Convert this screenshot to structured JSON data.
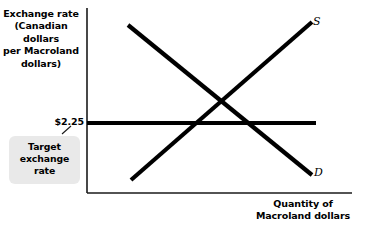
{
  "figure": {
    "background": "#ffffff",
    "ink_color": "#000000",
    "callout_bg": "#e9e9e9"
  },
  "axes": {
    "y_title": "Exchange rate (Canadian dollars per Macroland dollars)",
    "y_title_lines": [
      "Exchange rate",
      "(Canadian",
      "dollars",
      "per Macroland",
      "dollars)"
    ],
    "x_title": "Quantity of Macroland dollars",
    "x_title_lines": [
      "Quantity of",
      "Macroland dollars"
    ]
  },
  "annotations": {
    "target_rate_value": "$2.25",
    "target_callout_lines": [
      "Target",
      "exchange",
      "rate"
    ],
    "target_callout_text": "Target exchange rate"
  },
  "curves": {
    "supply_label": "S",
    "demand_label": "D"
  },
  "chart_data": {
    "type": "line",
    "title": "",
    "subtitle": "",
    "xlabel": "Quantity of Macroland dollars",
    "ylabel": "Exchange rate (Canadian dollars per Macroland dollars)",
    "grid": false,
    "legend_position": "inline-curve-end",
    "axis_ticks": {
      "y": [
        "$2.25"
      ],
      "x": []
    },
    "series": [
      {
        "name": "S",
        "label": "S",
        "description": "Upward sloping supply curve of Macroland dollars",
        "points": [
          [
            131,
            180
          ],
          [
            312,
            22
          ]
        ],
        "slope": "positive"
      },
      {
        "name": "D",
        "label": "D",
        "description": "Downward sloping demand curve for Macroland dollars",
        "points": [
          [
            128,
            25
          ],
          [
            312,
            175
          ]
        ],
        "slope": "negative"
      },
      {
        "name": "Target exchange rate",
        "label": "$2.25",
        "description": "Horizontal line at the fixed target exchange rate of $2.25, below the market equilibrium rate",
        "points": [
          [
            87,
            123
          ],
          [
            316,
            123
          ]
        ],
        "slope": "zero"
      }
    ],
    "annotations": [
      {
        "text": "$2.25",
        "role": "y-axis-value-label",
        "attached_to": "Target exchange rate"
      },
      {
        "text": "Target exchange rate",
        "role": "callout",
        "attached_to": "$2.25"
      }
    ],
    "equilibrium": {
      "description": "Supply and demand intersect above the target exchange rate line",
      "point": [
        223,
        103
      ]
    }
  }
}
